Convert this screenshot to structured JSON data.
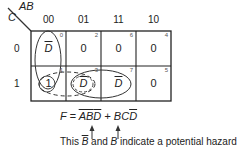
{
  "kmap": {
    "row_var": "C",
    "col_vars": "AB",
    "col_headers": [
      "00",
      "01",
      "11",
      "10"
    ],
    "row_headers": [
      "0",
      "1"
    ],
    "cells": [
      [
        {
          "index": "0",
          "value": "D",
          "overbar": true
        },
        {
          "index": "2",
          "value": "0",
          "overbar": false
        },
        {
          "index": "6",
          "value": "0",
          "overbar": false
        },
        {
          "index": "4",
          "value": "0",
          "overbar": false
        }
      ],
      [
        {
          "index": "1",
          "value": "1",
          "overbar": false
        },
        {
          "index": "3",
          "value": "D",
          "overbar": true
        },
        {
          "index": "7",
          "value": "D",
          "overbar": true
        },
        {
          "index": "5",
          "value": "0",
          "overbar": false
        }
      ]
    ],
    "groupings": [
      {
        "name": "A'B'D' loop",
        "style": "solid",
        "cells": [
          "0",
          "1"
        ]
      },
      {
        "name": "B'C hazard loop",
        "style": "dashed",
        "cells": [
          "1",
          "3"
        ]
      },
      {
        "name": "BCD' loop",
        "style": "solid",
        "cells": [
          "3",
          "7"
        ]
      }
    ]
  },
  "equation": {
    "prefix": "F = ",
    "term1_a": "A",
    "term1_b": "B",
    "term1_c": "D",
    "plus": " + ",
    "term2_bc": "BC",
    "term2_d": "D"
  },
  "caption": {
    "this": "This ",
    "b_bar": "B",
    "and": " and ",
    "b": "B",
    "rest": " indicate a potential hazard"
  },
  "colors": {
    "line": "#222222",
    "text": "#222222"
  }
}
